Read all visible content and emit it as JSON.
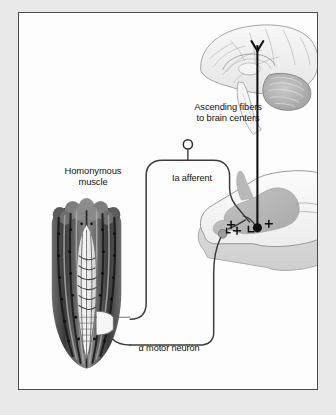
{
  "figure": {
    "background_color": "#e9e9e9",
    "panel_color": "#fdfdfd",
    "border_color": "#4a4a4a"
  },
  "labels": {
    "ascending_line1": "Ascending fibers",
    "ascending_line2": "to brain centers",
    "homonymous_line1": "Homonymous",
    "homonymous_line2": "muscle",
    "ia_afferent": "Ia afferent",
    "alpha_motor_neuron": "α motor neuron"
  },
  "structures": {
    "brain": {
      "name": "brain-midsagittal",
      "parts": [
        "cerebrum",
        "cerebellum",
        "brainstem",
        "corpus-callosum"
      ],
      "outline_color": "#8a8a8a",
      "fill_color": "#f2f2f2"
    },
    "spinal_cord": {
      "name": "spinal-cord-segment",
      "gray_matter_color": "#b8b8b8",
      "white_matter_color": "#efefef",
      "outline_color": "#8d8d8d"
    },
    "muscle": {
      "name": "skeletal-muscle-with-spindle",
      "parts": [
        "extrafusal-fibers",
        "muscle-spindle",
        "intrafusal-fibers",
        "annulospiral-ending"
      ],
      "fiber_dark": "#3a3a3a",
      "fiber_light": "#c9c9c9"
    }
  },
  "pathways": {
    "ia_afferent": {
      "name": "ia-afferent-fiber",
      "color": "#3c3c3c",
      "from": "muscle-spindle",
      "to": "spinal-cord-dorsal-horn"
    },
    "alpha_motor": {
      "name": "alpha-motor-axon",
      "color": "#3c3c3c",
      "from": "spinal-cord-ventral-horn",
      "to": "muscle"
    },
    "ascending": {
      "name": "ascending-tract",
      "color": "#101010",
      "from": "spinal-cord-relay-neuron",
      "to": "brain"
    }
  },
  "synapses": {
    "excitatory_sign": "+",
    "relay_neuron_sign": "+",
    "motor_neuron_sign": "+",
    "sensory_soma": "dorsal-root-ganglion-cell"
  }
}
